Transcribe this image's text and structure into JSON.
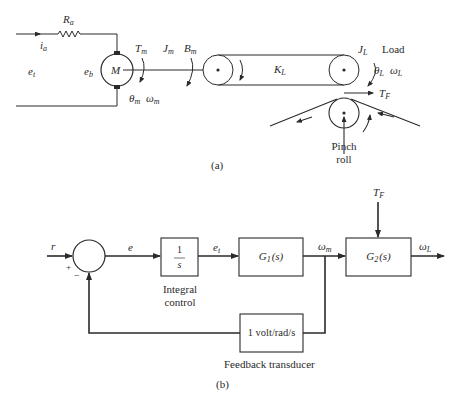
{
  "figure_a": {
    "caption": "(a)",
    "circuit": {
      "resistor": {
        "symbol": "R",
        "sub": "a"
      },
      "current": {
        "symbol": "i",
        "sub": "a"
      },
      "terminal_voltage": {
        "symbol": "e",
        "sub": "t"
      },
      "back_emf": {
        "symbol": "e",
        "sub": "b"
      },
      "motor_label": "M"
    },
    "motor_shaft": {
      "torque": {
        "symbol": "T",
        "sub": "m"
      },
      "inertia": {
        "symbol": "J",
        "sub": "m"
      },
      "friction": {
        "symbol": "B",
        "sub": "m"
      },
      "angle": {
        "symbol": "θ",
        "sub": "m"
      },
      "velocity": {
        "symbol": "ω",
        "sub": "m"
      }
    },
    "belt": {
      "symbol": "K",
      "sub": "L"
    },
    "load": {
      "label": "Load",
      "inertia": {
        "symbol": "J",
        "sub": "L"
      },
      "angle": {
        "symbol": "θ",
        "sub": "L"
      },
      "velocity": {
        "symbol": "ω",
        "sub": "L"
      },
      "tension": {
        "symbol": "T",
        "sub": "F"
      }
    },
    "pinch_roll_label_line1": "Pinch",
    "pinch_roll_label_line2": "roll"
  },
  "figure_b": {
    "caption": "(b)",
    "signals": {
      "reference": "r",
      "error": "e",
      "plus_sign": "+",
      "minus_sign": "−",
      "terminal_voltage": {
        "symbol": "e",
        "sub": "t"
      },
      "motor_speed": {
        "symbol": "ω",
        "sub": "m"
      },
      "load_speed": {
        "symbol": "ω",
        "sub": "L"
      },
      "disturbance": {
        "symbol": "T",
        "sub": "F"
      }
    },
    "blocks": {
      "integral": {
        "numerator": "1",
        "denominator": "s",
        "caption_line1": "Integral",
        "caption_line2": "control"
      },
      "g1": {
        "symbol": "G",
        "sub": "1",
        "arg": "(s)"
      },
      "g2": {
        "symbol": "G",
        "sub": "2",
        "arg": "(s)"
      },
      "feedback": {
        "text": "1 volt/rad/s",
        "caption": "Feedback transducer"
      }
    }
  },
  "colors": {
    "ink": "#2a2a2a",
    "background": "#ffffff"
  }
}
